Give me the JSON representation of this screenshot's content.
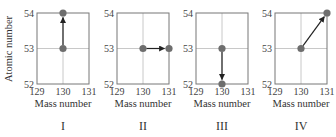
{
  "chart_data": [
    {
      "type": "scatter",
      "panel_label": "I",
      "xlabel": "Mass number",
      "ylabel": "Atomic number",
      "xlim": [
        129,
        131
      ],
      "ylim": [
        52,
        54
      ],
      "xticks": [
        "129",
        "130",
        "131"
      ],
      "yticks": [
        "52",
        "53",
        "54"
      ],
      "grid": true,
      "points": [
        {
          "x": 130,
          "y": 53
        },
        {
          "x": 130,
          "y": 54
        }
      ],
      "arrow": {
        "from": {
          "x": 130,
          "y": 53
        },
        "to": {
          "x": 130,
          "y": 54
        }
      }
    },
    {
      "type": "scatter",
      "panel_label": "II",
      "xlabel": "Mass number",
      "ylabel": "",
      "xlim": [
        129,
        131
      ],
      "ylim": [
        52,
        54
      ],
      "xticks": [
        "129",
        "130",
        "131"
      ],
      "yticks": [
        "52",
        "53",
        "54"
      ],
      "grid": true,
      "points": [
        {
          "x": 130,
          "y": 53
        },
        {
          "x": 131,
          "y": 53
        }
      ],
      "arrow": {
        "from": {
          "x": 130,
          "y": 53
        },
        "to": {
          "x": 131,
          "y": 53
        }
      }
    },
    {
      "type": "scatter",
      "panel_label": "III",
      "xlabel": "Mass number",
      "ylabel": "",
      "xlim": [
        129,
        131
      ],
      "ylim": [
        52,
        54
      ],
      "xticks": [
        "129",
        "130",
        "131"
      ],
      "yticks": [
        "52",
        "53",
        "54"
      ],
      "grid": true,
      "points": [
        {
          "x": 130,
          "y": 53
        },
        {
          "x": 130,
          "y": 52
        }
      ],
      "arrow": {
        "from": {
          "x": 130,
          "y": 53
        },
        "to": {
          "x": 130,
          "y": 52
        }
      }
    },
    {
      "type": "scatter",
      "panel_label": "IV",
      "xlabel": "Mass number",
      "ylabel": "",
      "xlim": [
        129,
        131
      ],
      "ylim": [
        52,
        54
      ],
      "xticks": [
        "129",
        "130",
        "131"
      ],
      "yticks": [
        "52",
        "53",
        "54"
      ],
      "grid": true,
      "points": [
        {
          "x": 130,
          "y": 53
        },
        {
          "x": 131,
          "y": 54
        }
      ],
      "arrow": {
        "from": {
          "x": 130,
          "y": 53
        },
        "to": {
          "x": 131,
          "y": 54
        }
      }
    }
  ],
  "labels": {
    "ylabel": "Atomic number",
    "xlabel": "Mass number",
    "panels": [
      "I",
      "II",
      "III",
      "IV"
    ],
    "xticks": [
      "129",
      "130",
      "131"
    ],
    "yticks": [
      "52",
      "53",
      "54"
    ]
  },
  "colors": {
    "axis": "#777777",
    "grid": "#c8c8c8",
    "marker": "#6e6e6e",
    "arrow": "#222222"
  }
}
